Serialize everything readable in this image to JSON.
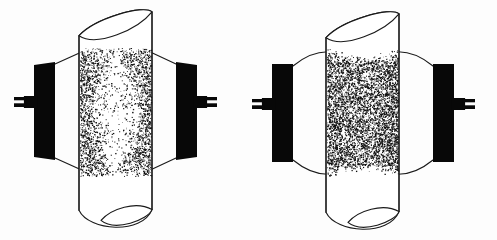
{
  "figure": {
    "background_color": "#fdfdfd",
    "line_color": "#1a1a1a",
    "electrode_color": "#080808",
    "speckle_color": "#101010",
    "panel_count": 2
  },
  "panels": [
    {
      "id": "left-panel",
      "label": "left-discharge-tube",
      "center_x": 125,
      "cylinder": {
        "label": "cylinder-tube",
        "left_x": 79,
        "right_x": 152,
        "top_y": 14,
        "bottom_y": 218,
        "cap_rx": 36.5,
        "cap_ry": 14,
        "tilt": "angled-cut",
        "fill": "#ffffff"
      },
      "electrodes": [
        {
          "label": "electrode-left",
          "side": "left",
          "x": 34,
          "y": 62,
          "width": 21,
          "height": 98,
          "shape": "trapezoid"
        },
        {
          "label": "electrode-right",
          "side": "right",
          "x": 176,
          "y": 62,
          "width": 21,
          "height": 98,
          "shape": "trapezoid"
        }
      ],
      "leads": [
        {
          "label": "lead-left",
          "side": "left",
          "x": 14,
          "y": 97,
          "width": 22,
          "height": 10,
          "stub_gap": true
        },
        {
          "label": "lead-right",
          "side": "right",
          "x": 195,
          "y": 97,
          "width": 22,
          "height": 10,
          "stub_gap": true
        }
      ],
      "connectors": {
        "label": "electrode-to-tube-connectors",
        "style": "straight",
        "top_left": [
          55,
          64,
          86,
          50
        ],
        "bottom_left": [
          55,
          158,
          86,
          172
        ],
        "top_right": [
          176,
          64,
          146,
          50
        ],
        "bottom_right": [
          176,
          158,
          146,
          172
        ]
      },
      "speckle": {
        "label": "particle-field-hourglass",
        "pattern": "hourglass",
        "description": "Dense dark bands hugging both electrode faces, pinched to a sparse waist at mid-height",
        "x_min": 80,
        "x_max": 151,
        "y_min": 48,
        "y_max": 176,
        "dot_count": 5200,
        "waist_ratio": 0.18,
        "edge_density": 1.0,
        "seed": 1971
      }
    },
    {
      "id": "right-panel",
      "label": "right-discharge-tube",
      "center_x": 369,
      "cylinder": {
        "label": "cylinder-tube",
        "left_x": 326,
        "right_x": 399,
        "top_y": 16,
        "bottom_y": 220,
        "cap_rx": 36.5,
        "cap_ry": 14,
        "tilt": "angled-cut",
        "fill": "#ffffff"
      },
      "electrodes": [
        {
          "label": "electrode-left",
          "side": "left",
          "x": 272,
          "y": 64,
          "width": 21,
          "height": 98,
          "shape": "rectangle"
        },
        {
          "label": "electrode-right",
          "side": "right",
          "x": 433,
          "y": 64,
          "width": 21,
          "height": 98,
          "shape": "rectangle"
        }
      ],
      "leads": [
        {
          "label": "lead-left",
          "side": "left",
          "x": 252,
          "y": 99,
          "width": 22,
          "height": 10,
          "stub_gap": true
        },
        {
          "label": "lead-right",
          "side": "right",
          "x": 453,
          "y": 99,
          "width": 22,
          "height": 10,
          "stub_gap": true
        }
      ],
      "connectors": {
        "label": "electrode-to-tube-connectors",
        "style": "curved",
        "top_left": [
          293,
          66,
          332,
          52
        ],
        "bottom_left": [
          293,
          160,
          332,
          174
        ],
        "top_right": [
          433,
          66,
          394,
          52
        ],
        "bottom_right": [
          433,
          160,
          394,
          174
        ]
      },
      "speckle": {
        "label": "particle-field-uniform",
        "pattern": "uniform-full",
        "description": "Dense particle fill spanning the full tube width between electrodes, slightly concave top and bottom edges",
        "x_min": 327,
        "x_max": 398,
        "y_min": 48,
        "y_max": 178,
        "dot_count": 6400,
        "waist_ratio": 0.82,
        "edge_density": 1.0,
        "seed": 4409
      }
    }
  ]
}
